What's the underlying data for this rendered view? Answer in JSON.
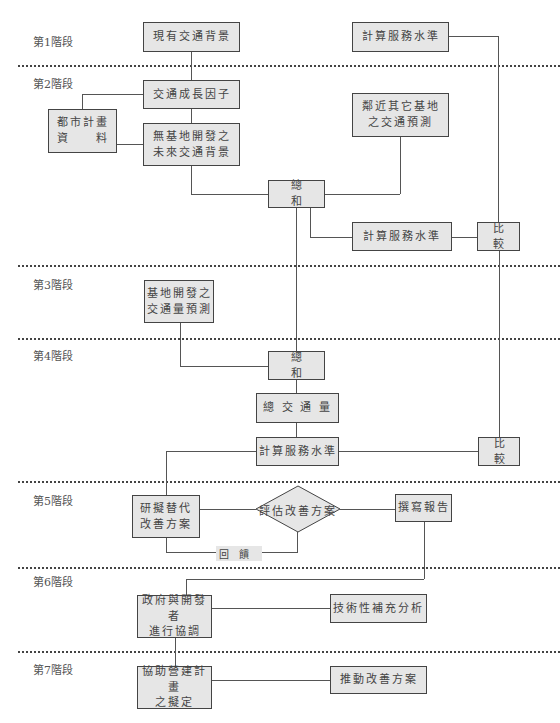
{
  "stages": [
    {
      "label": "第1階段",
      "y": 22
    },
    {
      "label": "第2階段",
      "y": 75
    },
    {
      "label": "第3階段",
      "y": 276
    },
    {
      "label": "第4階段",
      "y": 347
    },
    {
      "label": "第5階段",
      "y": 492
    },
    {
      "label": "第6階段",
      "y": 573
    },
    {
      "label": "第7階段",
      "y": 661
    }
  ],
  "separators_y": [
    66,
    266,
    338,
    481,
    567,
    652
  ],
  "nodes": {
    "existing_traffic": "現有交通背景",
    "calc_service_top": "計算服務水準",
    "growth_factor": "交通成長因子",
    "urban_plan_data": "都市計畫\n資　　料",
    "future_without_site": "無基地開發之\n未來交通背景",
    "nearby_sites_forecast": "鄰近其它基地\n之交通預測",
    "sum_1": "總和",
    "calc_service_2": "計算服務水準",
    "compare_1": "比較",
    "site_forecast": "基地開發之\n交通量預測",
    "sum_2": "總和",
    "total_volume": "總 交 通 量",
    "calc_service_3": "計算服務水準",
    "compare_2": "比較",
    "alt_plans": "研擬替代\n改善方案",
    "evaluate": "評估改善方案",
    "feedback": "回饋",
    "report": "撰寫報告",
    "coordination": "政府與開發者\n進行協調",
    "tech_analysis": "技術性補充分析",
    "construction_plan": "協助營建計畫\n之擬定",
    "implement": "推動改善方案"
  },
  "colors": {
    "box_fill": "#e6e6e6",
    "box_border": "#444444",
    "line": "#555555"
  }
}
